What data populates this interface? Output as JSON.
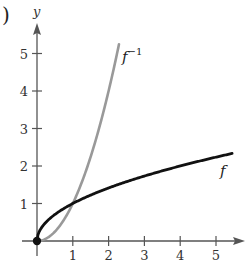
{
  "panel_label": ")",
  "chart_data": {
    "type": "line",
    "title": "",
    "xlabel": "",
    "ylabel": "y",
    "xlim": [
      0,
      5.7
    ],
    "ylim": [
      0,
      5.7
    ],
    "x_ticks": [
      1,
      2,
      3,
      4,
      5
    ],
    "y_ticks": [
      1,
      2,
      3,
      4,
      5
    ],
    "grid": false,
    "legend": "inline labels",
    "series": [
      {
        "name": "f",
        "label": "f",
        "function": "sqrt(x)",
        "color": "#111111",
        "x": [
          0,
          0.05,
          0.25,
          0.5,
          1,
          1.5,
          2,
          2.5,
          3,
          3.5,
          4,
          4.5,
          5,
          5.45
        ],
        "y": [
          0,
          0.22,
          0.5,
          0.71,
          1,
          1.22,
          1.41,
          1.58,
          1.73,
          1.87,
          2,
          2.12,
          2.24,
          2.33
        ]
      },
      {
        "name": "f_inverse",
        "label": "f",
        "label_superscript": "−1",
        "function": "x^2",
        "color": "#999999",
        "x": [
          0,
          0.25,
          0.5,
          0.75,
          1,
          1.25,
          1.5,
          1.75,
          2,
          2.29
        ],
        "y": [
          0,
          0.06,
          0.25,
          0.56,
          1,
          1.56,
          2.25,
          3.06,
          4,
          5.24
        ]
      }
    ],
    "annotations": [
      {
        "type": "point",
        "x": 0,
        "y": 0,
        "label": "origin",
        "filled": true
      }
    ]
  },
  "labels": {
    "y_axis": "y",
    "x_ticks": [
      "1",
      "2",
      "3",
      "4",
      "5"
    ],
    "y_ticks": [
      "1",
      "2",
      "3",
      "4",
      "5"
    ],
    "f_label": "f",
    "finv_base": "f",
    "finv_sup": "−1"
  }
}
